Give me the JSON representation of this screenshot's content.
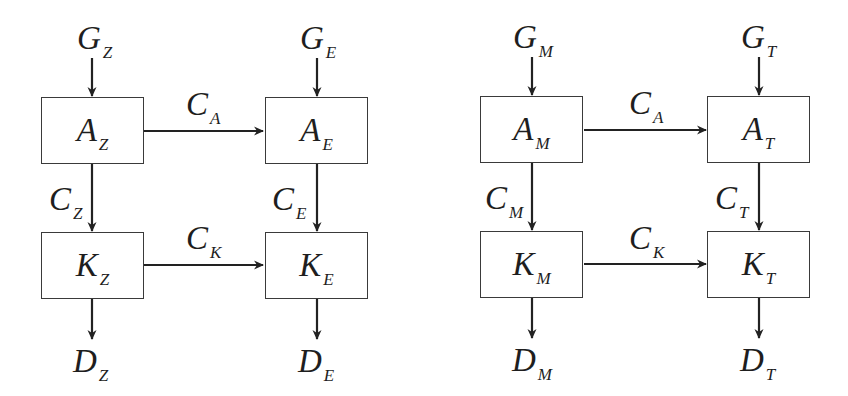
{
  "figure": {
    "partial_label": ")",
    "left_diagram": {
      "inputs": {
        "g1": {
          "main": "G",
          "sub": "Z"
        },
        "g2": {
          "main": "G",
          "sub": "E"
        }
      },
      "boxes": {
        "a1": {
          "main": "A",
          "sub": "Z"
        },
        "a2": {
          "main": "A",
          "sub": "E"
        },
        "k1": {
          "main": "K",
          "sub": "Z"
        },
        "k2": {
          "main": "K",
          "sub": "E"
        }
      },
      "edges": {
        "ca": {
          "main": "C",
          "sub": "A"
        },
        "ck": {
          "main": "C",
          "sub": "K"
        },
        "c1": {
          "main": "C",
          "sub": "Z"
        },
        "c2": {
          "main": "C",
          "sub": "E"
        }
      },
      "outputs": {
        "d1": {
          "main": "D",
          "sub": "Z"
        },
        "d2": {
          "main": "D",
          "sub": "E"
        }
      }
    },
    "right_diagram": {
      "inputs": {
        "g1": {
          "main": "G",
          "sub": "M"
        },
        "g2": {
          "main": "G",
          "sub": "T"
        }
      },
      "boxes": {
        "a1": {
          "main": "A",
          "sub": "M"
        },
        "a2": {
          "main": "A",
          "sub": "T"
        },
        "k1": {
          "main": "K",
          "sub": "M"
        },
        "k2": {
          "main": "K",
          "sub": "T"
        }
      },
      "edges": {
        "ca": {
          "main": "C",
          "sub": "A"
        },
        "ck": {
          "main": "C",
          "sub": "K"
        },
        "c1": {
          "main": "C",
          "sub": "M"
        },
        "c2": {
          "main": "C",
          "sub": "T"
        }
      },
      "outputs": {
        "d1": {
          "main": "D",
          "sub": "M"
        },
        "d2": {
          "main": "D",
          "sub": "T"
        }
      }
    }
  },
  "colors": {
    "line": "#222222",
    "box_border": "#3a3a3a",
    "text": "#1e1e1e",
    "background": "#ffffff"
  }
}
